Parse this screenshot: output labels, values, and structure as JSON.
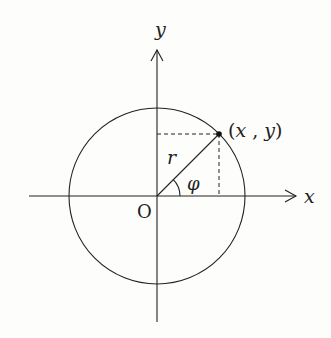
{
  "diagram": {
    "type": "polar-coordinates-unit-circle",
    "labels": {
      "y_axis": "y",
      "x_axis": "x",
      "origin": "O",
      "radius": "r",
      "angle": "φ",
      "point_open": "(",
      "point_x": "x",
      "point_comma": " , ",
      "point_y": "y",
      "point_close": ")"
    },
    "colors": {
      "stroke": "#222222",
      "background": "#fdfdfb"
    }
  }
}
